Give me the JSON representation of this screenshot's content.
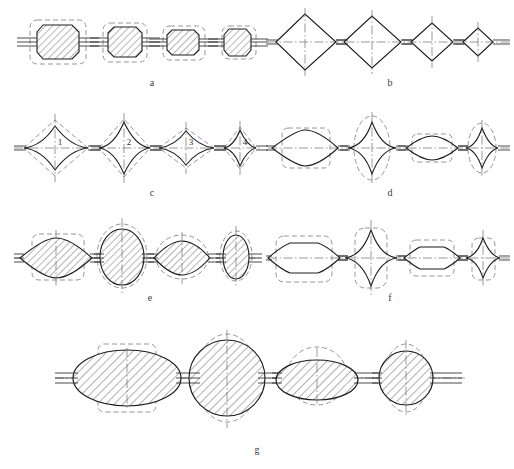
{
  "figure": {
    "background_color": "#ffffff",
    "line_color": "#1c1c1c",
    "dashed_color": "#8a8a8a",
    "centerline_color": "#6e6e6e",
    "hatch_color": "#333333",
    "width": 514,
    "height": 469
  },
  "row_labels": {
    "a": "a",
    "b": "b",
    "c": "c",
    "d": "d",
    "e": "e",
    "f": "f",
    "g": "g"
  },
  "inner_numbers": {
    "n1": "1",
    "n2": "2",
    "n3": "3",
    "n4": "4"
  },
  "rows": [
    {
      "id": "a",
      "label": "a",
      "label_x": 152,
      "label_y": 86,
      "description": "Four hatched octagonal (chamfered rectangle) sections of decreasing size with dashed rounded-rectangle envelopes and horizontal lead wires",
      "shapes": [
        {
          "kind": "octagon",
          "cx": 57,
          "cy": 42,
          "w": 58,
          "h": 36,
          "overlay": "dashed-rounded-rect",
          "hatched": true
        },
        {
          "kind": "octagon",
          "cx": 125,
          "cy": 42,
          "w": 42,
          "h": 33,
          "overlay": "dashed-rounded-rect",
          "hatched": true
        },
        {
          "kind": "octagon",
          "cx": 183,
          "cy": 42,
          "w": 40,
          "h": 28,
          "overlay": "dashed-rounded-rect",
          "hatched": true
        },
        {
          "kind": "octagon",
          "cx": 238,
          "cy": 42,
          "w": 31,
          "h": 27,
          "overlay": "dashed-rounded-rect",
          "hatched": true
        }
      ]
    },
    {
      "id": "b",
      "label": "b",
      "label_x": 390,
      "label_y": 86,
      "description": "Four diamond (rhombus) sections of decreasing size chained along a common axis with vertical and horizontal centerlines",
      "shapes": [
        {
          "kind": "diamond",
          "cx": 305,
          "cy": 42,
          "w": 62,
          "h": 56,
          "overlay": "centerlines",
          "hatched": false
        },
        {
          "kind": "diamond",
          "cx": 372,
          "cy": 42,
          "w": 58,
          "h": 52,
          "overlay": "centerlines",
          "hatched": false
        },
        {
          "kind": "diamond",
          "cx": 432,
          "cy": 42,
          "w": 42,
          "h": 40,
          "overlay": "centerlines",
          "hatched": false
        },
        {
          "kind": "diamond",
          "cx": 478,
          "cy": 42,
          "w": 30,
          "h": 30,
          "overlay": "centerlines",
          "hatched": false
        }
      ]
    },
    {
      "id": "c",
      "label": "c",
      "label_x": 152,
      "label_y": 196,
      "description": "Four concave-sided ogive/star sections numbered 1 to 4 with dashed diamond envelopes and cross centerlines",
      "shapes": [
        {
          "kind": "ogive",
          "cx": 55,
          "cy": 148,
          "w": 62,
          "h": 52,
          "overlay": "dashed-diamond",
          "number": "1"
        },
        {
          "kind": "ogive",
          "cx": 124,
          "cy": 148,
          "w": 52,
          "h": 58,
          "overlay": "dashed-diamond",
          "number": "2"
        },
        {
          "kind": "ogive",
          "cx": 186,
          "cy": 148,
          "w": 56,
          "h": 40,
          "overlay": "dashed-diamond",
          "number": "3"
        },
        {
          "kind": "ogive",
          "cx": 240,
          "cy": 148,
          "w": 32,
          "h": 42,
          "overlay": "dashed-diamond",
          "number": "4"
        }
      ]
    },
    {
      "id": "d",
      "label": "d",
      "label_x": 390,
      "label_y": 196,
      "description": "Alternating lens sections with dashed rounded-rectangle envelopes and diamond sections with dashed ellipse envelopes",
      "shapes": [
        {
          "kind": "lens",
          "cx": 305,
          "cy": 148,
          "w": 66,
          "h": 32,
          "overlay": "dashed-rounded-rect"
        },
        {
          "kind": "diamond-concave",
          "cx": 372,
          "cy": 148,
          "w": 36,
          "h": 56,
          "overlay": "dashed-ellipse"
        },
        {
          "kind": "lens",
          "cx": 432,
          "cy": 148,
          "w": 52,
          "h": 26,
          "overlay": "dashed-rounded-rect"
        },
        {
          "kind": "diamond-concave",
          "cx": 482,
          "cy": 148,
          "w": 28,
          "h": 44,
          "overlay": "dashed-ellipse"
        }
      ]
    },
    {
      "id": "e",
      "label": "e",
      "label_x": 150,
      "label_y": 301,
      "description": "Four hatched lens/ellipse sections, alternating wide-flat and tall-round, with dashed rectangle or ellipse envelopes",
      "shapes": [
        {
          "kind": "lens",
          "cx": 55,
          "cy": 258,
          "w": 70,
          "h": 36,
          "overlay": "dashed-rounded-rect",
          "hatched": true
        },
        {
          "kind": "ellipse",
          "cx": 122,
          "cy": 256,
          "w": 44,
          "h": 56,
          "overlay": "dashed-ellipse",
          "hatched": true
        },
        {
          "kind": "lens",
          "cx": 182,
          "cy": 258,
          "w": 56,
          "h": 34,
          "overlay": "dashed-ellipse",
          "hatched": true
        },
        {
          "kind": "ellipse",
          "cx": 236,
          "cy": 257,
          "w": 28,
          "h": 44,
          "overlay": "dashed-ellipse",
          "hatched": true
        }
      ]
    },
    {
      "id": "f",
      "label": "f",
      "label_x": 390,
      "label_y": 301,
      "description": "Alternating flat-topped octagon sections with dashed rounded-rectangle envelopes and diamond sections with dashed rounded envelopes",
      "shapes": [
        {
          "kind": "octagon-open",
          "cx": 303,
          "cy": 258,
          "w": 70,
          "h": 38,
          "overlay": "dashed-rounded-rect"
        },
        {
          "kind": "diamond-concave",
          "cx": 371,
          "cy": 258,
          "w": 40,
          "h": 56,
          "overlay": "dashed-rounded-rect"
        },
        {
          "kind": "octagon-open",
          "cx": 432,
          "cy": 258,
          "w": 54,
          "h": 28,
          "overlay": "dashed-rounded-rect"
        },
        {
          "kind": "diamond-concave",
          "cx": 483,
          "cy": 258,
          "w": 26,
          "h": 40,
          "overlay": "dashed-rounded-rect"
        }
      ]
    },
    {
      "id": "g",
      "label": "g",
      "label_x": 257,
      "label_y": 453,
      "description": "Large-scale row: four hatched ellipse and circle sections with dashed rectangle or circle envelopes and triple lead lines",
      "shapes": [
        {
          "kind": "ellipse",
          "cx": 127,
          "cy": 378,
          "w": 108,
          "h": 56,
          "overlay": "dashed-rounded-rect",
          "hatched": true
        },
        {
          "kind": "circle",
          "cx": 227,
          "cy": 378,
          "w": 74,
          "h": 76,
          "overlay": "dashed-ellipse",
          "hatched": true
        },
        {
          "kind": "ellipse",
          "cx": 317,
          "cy": 380,
          "w": 82,
          "h": 40,
          "overlay": "dashed-ellipse",
          "hatched": true
        },
        {
          "kind": "circle",
          "cx": 406,
          "cy": 378,
          "w": 54,
          "h": 56,
          "overlay": "dashed-ellipse",
          "hatched": true
        }
      ]
    }
  ]
}
